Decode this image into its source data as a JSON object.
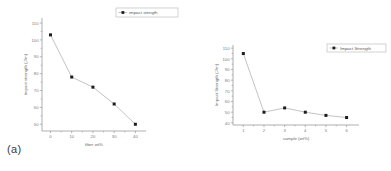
{
  "figure": {
    "background": "#ffffff",
    "panels": [
      {
        "caption": "(a)"
      },
      {
        "caption": "(b)"
      }
    ]
  },
  "colors": {
    "axis": "#8d8d8d",
    "line": "#9a9a9a",
    "marker": "#1c1c1c",
    "tick_text": "#7a7a7a",
    "title_text": "#6e6e6e",
    "legend_border": "#b4b4b4",
    "caption_text": "#3a3a3a"
  },
  "chart_data": [
    {
      "type": "line",
      "panel": "a",
      "title": "",
      "xlabel": "fiber wt%",
      "ylabel": "impact strength (J/m)",
      "legend": [
        "impact stength"
      ],
      "legend_position": "top-right-outside",
      "grid": false,
      "marker": "filled-square",
      "x": [
        0,
        10,
        20,
        30,
        40
      ],
      "values": [
        103,
        78,
        72,
        62,
        50
      ],
      "xticks": [
        "0",
        "10",
        "20",
        "30",
        "40"
      ],
      "yticks": [
        "50",
        "60",
        "70",
        "80",
        "90",
        "100",
        "110"
      ],
      "xlim": [
        -4,
        45
      ],
      "ylim": [
        46,
        113
      ]
    },
    {
      "type": "line",
      "panel": "b",
      "title": "",
      "xlabel": "sample (wt%)",
      "ylabel": "Impact Strength (J/m)",
      "legend": [
        "Impact Strength"
      ],
      "legend_position": "top-right-inside",
      "grid": false,
      "marker": "filled-square",
      "x": [
        1,
        2,
        3,
        4,
        5,
        6
      ],
      "values": [
        105,
        50,
        54,
        50,
        47,
        45
      ],
      "xticks": [
        "1",
        "2",
        "3",
        "4",
        "5",
        "6"
      ],
      "yticks": [
        "40",
        "50",
        "60",
        "70",
        "80",
        "90",
        "100",
        "110"
      ],
      "xlim": [
        0.5,
        6.6
      ],
      "ylim": [
        38,
        113
      ]
    }
  ]
}
